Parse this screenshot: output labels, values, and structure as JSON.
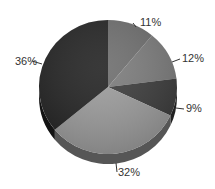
{
  "chart_data": {
    "type": "pie",
    "title": "",
    "style": "3d",
    "start_angle_deg": 0,
    "direction": "clockwise",
    "slices": [
      {
        "label": "11%",
        "value": 11,
        "color": "#6e6e6e"
      },
      {
        "label": "12%",
        "value": 12,
        "color": "#7c7c7c"
      },
      {
        "label": "9%",
        "value": 9,
        "color": "#3c3c3c"
      },
      {
        "label": "32%",
        "value": 32,
        "color": "#9c9c9c"
      },
      {
        "label": "36%",
        "value": 36,
        "color": "#232323"
      }
    ],
    "legend": null
  }
}
